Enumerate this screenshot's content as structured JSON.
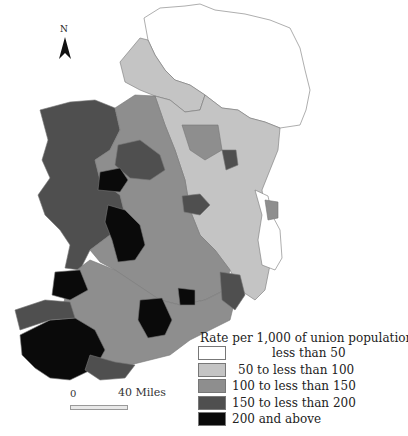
{
  "map": {
    "title": "Rate per 1,000 of union population",
    "subject": "Ireland poor law unions choropleth",
    "north_label": "N",
    "scale": {
      "start": "0",
      "end": "40",
      "unit": "Miles"
    },
    "legend": {
      "title": "Rate per 1,000 of union population",
      "items": [
        {
          "label": "less than  50",
          "color": "#ffffff"
        },
        {
          "label": "50 to less than 100",
          "color": "#c4c4c4"
        },
        {
          "label": "100 to less than 150",
          "color": "#8e8e8e"
        },
        {
          "label": "150 to less than 200",
          "color": "#4f4f4f"
        },
        {
          "label": "200 and above",
          "color": "#0a0a0a"
        }
      ]
    },
    "colors": {
      "c0": "#ffffff",
      "c1": "#c4c4c4",
      "c2": "#8e8e8e",
      "c3": "#4f4f4f",
      "c4": "#0a0a0a",
      "border": "#777777"
    }
  }
}
